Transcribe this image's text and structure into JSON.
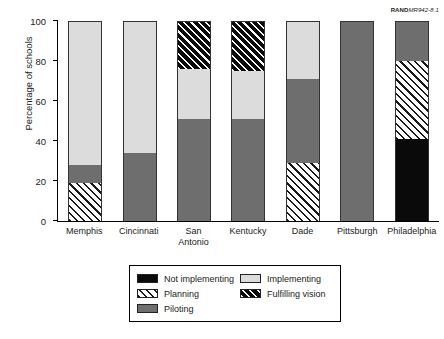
{
  "figure_tag": {
    "prefix": "RAND",
    "number": "MR942-8.1"
  },
  "chart_data": {
    "type": "bar",
    "subtype": "stacked-bar-100",
    "title": "",
    "xlabel": "",
    "ylabel": "Percentage of schools",
    "ylim": [
      0,
      100
    ],
    "yticks": [
      0,
      20,
      40,
      60,
      80,
      100
    ],
    "grid": false,
    "legend_position": "bottom",
    "categories": [
      "Memphis",
      "San Antonio",
      "Cincinnati",
      "Kentucky",
      "Dade",
      "Pittsburgh",
      "Philadelphia"
    ],
    "category_lines": [
      [
        "Memphis"
      ],
      [
        "Cincinnati"
      ],
      [
        "San",
        "Antonio"
      ],
      [
        "Kentucky"
      ],
      [
        "Dade"
      ],
      [
        "Pittsburgh"
      ],
      [
        "Philadelphia"
      ]
    ],
    "series": [
      {
        "name": "Not implementing",
        "pattern": "solid",
        "color": "#0a0a0a",
        "values": [
          0,
          0,
          0,
          0,
          0,
          0,
          41
        ]
      },
      {
        "name": "Planning",
        "pattern": "diagonal-hatch-light",
        "color": "#ffffff",
        "values": [
          19,
          0,
          0,
          0,
          29,
          0,
          39
        ]
      },
      {
        "name": "Piloting",
        "pattern": "solid",
        "color": "#6e6e6e",
        "values": [
          9,
          34,
          51,
          51,
          42,
          100,
          20
        ]
      },
      {
        "name": "Implementing",
        "pattern": "solid",
        "color": "#dcdcdc",
        "values": [
          72,
          66,
          25,
          24,
          29,
          0,
          0
        ]
      },
      {
        "name": "Fulfilling vision",
        "pattern": "diagonal-hatch-dark",
        "color": "#0a0a0a",
        "values": [
          0,
          0,
          24,
          25,
          0,
          0,
          0
        ]
      }
    ],
    "stack_order_bottom_to_top": [
      "Not implementing",
      "Planning",
      "Piloting",
      "Implementing",
      "Fulfilling vision"
    ],
    "bars": [
      {
        "category": "Memphis",
        "Not implementing": 0,
        "Planning": 19,
        "Piloting": 9,
        "Implementing": 72,
        "Fulfilling vision": 0
      },
      {
        "category": "Cincinnati",
        "Not implementing": 0,
        "Planning": 0,
        "Piloting": 34,
        "Implementing": 66,
        "Fulfilling vision": 0
      },
      {
        "category": "San Antonio",
        "Not implementing": 0,
        "Planning": 0,
        "Piloting": 51,
        "Implementing": 25,
        "Fulfilling vision": 24
      },
      {
        "category": "Kentucky",
        "Not implementing": 0,
        "Planning": 0,
        "Piloting": 51,
        "Implementing": 24,
        "Fulfilling vision": 25
      },
      {
        "category": "Dade",
        "Not implementing": 0,
        "Planning": 29,
        "Piloting": 42,
        "Implementing": 29,
        "Fulfilling vision": 0
      },
      {
        "category": "Pittsburgh",
        "Not implementing": 0,
        "Planning": 0,
        "Piloting": 100,
        "Implementing": 0,
        "Fulfilling vision": 0
      },
      {
        "category": "Philadelphia",
        "Not implementing": 41,
        "Planning": 39,
        "Piloting": 20,
        "Implementing": 0,
        "Fulfilling vision": 0
      }
    ],
    "legend": [
      {
        "label": "Not implementing",
        "swatch": "fill-not-implementing"
      },
      {
        "label": "Implementing",
        "swatch": "fill-implementing"
      },
      {
        "label": "Planning",
        "swatch": "fill-planning"
      },
      {
        "label": "Fulfilling vision",
        "swatch": "fill-fulfilling"
      },
      {
        "label": "Piloting",
        "swatch": "fill-piloting"
      }
    ]
  }
}
